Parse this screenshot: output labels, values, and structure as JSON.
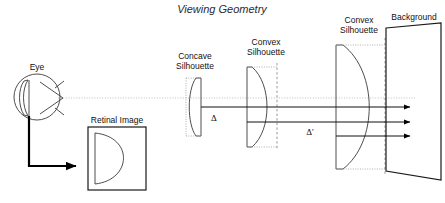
{
  "figure": {
    "title": "Viewing Geometry",
    "width": 445,
    "height": 203,
    "background_color": "#ffffff",
    "line_color": "#1a1a1a",
    "sightline_color": "#b9b9b9",
    "dash_color": "#8c8c8c"
  },
  "labels": {
    "eye": "Eye",
    "retinal_image": "Retinal Image",
    "concave_silhouette_line1": "Concave",
    "concave_silhouette_line2": "Silhouette",
    "convex_silhouette_near_line1": "Convex",
    "convex_silhouette_near_line2": "Silhouette",
    "convex_silhouette_far_line1": "Convex",
    "convex_silhouette_far_line2": "Silhouette",
    "background": "Background",
    "delta": "Δ",
    "delta_prime": "Δ'"
  },
  "elements": {
    "eye": {
      "name": "eye-diagram",
      "description": "circle with lens on left and vision cone triangle",
      "center_x": 37,
      "center_y": 97,
      "radius": 23
    },
    "retinal_image_box": {
      "name": "retinal-image-box",
      "x": 88,
      "y": 127,
      "width": 58,
      "height": 63,
      "contains": "half-disk bulging right"
    },
    "concave_silhouette": {
      "name": "concave-silhouette-shape",
      "x": 187,
      "top_y": 78,
      "bottom_y": 136,
      "curve_direction": "left"
    },
    "convex_silhouette_near": {
      "name": "convex-silhouette-near-shape",
      "x": 246,
      "top_y": 67,
      "bottom_y": 147,
      "curve_direction": "right"
    },
    "convex_silhouette_far": {
      "name": "convex-silhouette-far-shape",
      "x": 335,
      "top_y": 45,
      "bottom_y": 169,
      "curve_direction": "right"
    },
    "background_plane": {
      "name": "background-plane",
      "left_x": 385,
      "right_x": 440,
      "description": "tilted quadrilateral"
    },
    "rays": {
      "name": "ray-arrows",
      "count": 3,
      "direction": "right",
      "y_positions": [
        107,
        122,
        136
      ]
    },
    "sight_line": {
      "name": "line-of-sight",
      "y": 98,
      "style": "dotted"
    }
  }
}
